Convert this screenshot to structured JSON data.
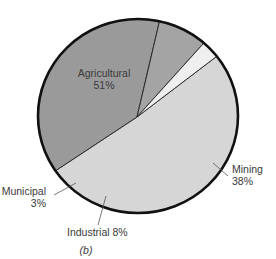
{
  "chart_data": {
    "type": "pie",
    "title": "",
    "caption": "(b)",
    "categories": [
      "Agricultural",
      "Mining",
      "Industrial",
      "Municipal"
    ],
    "values": [
      51,
      38,
      8,
      3
    ],
    "unit": "%",
    "slices": [
      {
        "name": "Agricultural",
        "value": 51,
        "display": "Agricultural",
        "pct": "51%",
        "color": "#d6d6d6"
      },
      {
        "name": "Mining",
        "value": 38,
        "display": "Mining",
        "pct": "38%",
        "color": "#9a9a9a"
      },
      {
        "name": "Industrial",
        "value": 8,
        "display": "Industrial 8%",
        "pct": "8%",
        "color": "#a4a4a4"
      },
      {
        "name": "Municipal",
        "value": 3,
        "display": "Municipal",
        "pct": "3%",
        "color": "#efefef"
      }
    ],
    "start_angle_deg": -38,
    "outline_color": "#111111",
    "legend": "none (direct labels with leader lines)"
  },
  "labels": {
    "agricultural_name": "Agricultural",
    "agricultural_pct": "51%",
    "mining_name": "Mining",
    "mining_pct": "38%",
    "industrial": "Industrial 8%",
    "municipal_name": "Municipal",
    "municipal_pct": "3%",
    "caption": "(b)"
  }
}
